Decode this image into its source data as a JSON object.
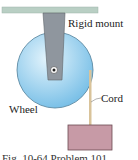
{
  "figure": {
    "labels": {
      "mount": "Rigid mount",
      "wheel": "Wheel",
      "cord": "Cord"
    },
    "caption": "Fig. 10-64   Problem 101.",
    "colors": {
      "ceiling": "#b9cfc4",
      "mount": "#8f969e",
      "wheel_light": "#d8eefa",
      "wheel_dark": "#7cc3e8",
      "cord": "#d9c39a",
      "block": "#c79aa6",
      "outline": "#555555"
    }
  }
}
